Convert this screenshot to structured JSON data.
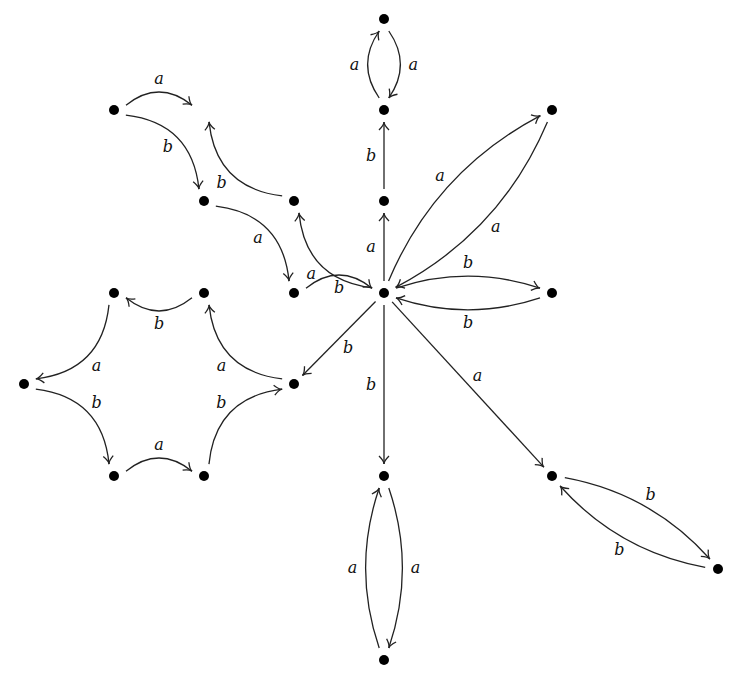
{
  "diagram": {
    "type": "directed-labeled-graph",
    "nodes": [
      {
        "id": "hub",
        "x": 384,
        "y": 293,
        "visible": true
      },
      {
        "id": "t1",
        "x": 384,
        "y": 201,
        "visible": true
      },
      {
        "id": "t2",
        "x": 384,
        "y": 110,
        "visible": true
      },
      {
        "id": "t3",
        "x": 384,
        "y": 19,
        "visible": true
      },
      {
        "id": "r1",
        "x": 552,
        "y": 110,
        "visible": true
      },
      {
        "id": "r2",
        "x": 552,
        "y": 293,
        "visible": true
      },
      {
        "id": "r3",
        "x": 552,
        "y": 476,
        "visible": true
      },
      {
        "id": "r4",
        "x": 718,
        "y": 569,
        "visible": true
      },
      {
        "id": "b1",
        "x": 384,
        "y": 476,
        "visible": true
      },
      {
        "id": "b2",
        "x": 384,
        "y": 660,
        "visible": true
      },
      {
        "id": "u1",
        "x": 294,
        "y": 201,
        "visible": true
      },
      {
        "id": "u0",
        "x": 204,
        "y": 110,
        "visible": false
      },
      {
        "id": "u2",
        "x": 114,
        "y": 110,
        "visible": true
      },
      {
        "id": "u3",
        "x": 204,
        "y": 201,
        "visible": true
      },
      {
        "id": "u4",
        "x": 294,
        "y": 293,
        "visible": true
      },
      {
        "id": "c1",
        "x": 294,
        "y": 384,
        "visible": true
      },
      {
        "id": "c2",
        "x": 204,
        "y": 293,
        "visible": true
      },
      {
        "id": "c3",
        "x": 114,
        "y": 293,
        "visible": true
      },
      {
        "id": "c4",
        "x": 24,
        "y": 384,
        "visible": true
      },
      {
        "id": "c5",
        "x": 114,
        "y": 476,
        "visible": true
      },
      {
        "id": "c6",
        "x": 204,
        "y": 476,
        "visible": true
      }
    ],
    "edges": [
      {
        "from": "hub",
        "to": "t1",
        "label": "a",
        "bend": 0,
        "labelSide": "left"
      },
      {
        "from": "t1",
        "to": "t2",
        "label": "b",
        "bend": 0,
        "labelSide": "left"
      },
      {
        "from": "t2",
        "to": "t3",
        "label": "a",
        "bend": 0.18,
        "labelSide": "left"
      },
      {
        "from": "t3",
        "to": "t2",
        "label": "a",
        "bend": 0.18,
        "labelSide": "left"
      },
      {
        "from": "hub",
        "to": "r1",
        "label": "a",
        "bend": 0.1,
        "labelSide": "left"
      },
      {
        "from": "r1",
        "to": "hub",
        "label": "a",
        "bend": 0.1,
        "labelSide": "left"
      },
      {
        "from": "hub",
        "to": "r2",
        "label": "b",
        "bend": 0.1,
        "labelSide": "left"
      },
      {
        "from": "r2",
        "to": "hub",
        "label": "b",
        "bend": 0.1,
        "labelSide": "left"
      },
      {
        "from": "hub",
        "to": "r3",
        "label": "a",
        "bend": 0,
        "labelSide": "left"
      },
      {
        "from": "r3",
        "to": "r4",
        "label": "b",
        "bend": 0.1,
        "labelSide": "left"
      },
      {
        "from": "r4",
        "to": "r3",
        "label": "b",
        "bend": 0.1,
        "labelSide": "left"
      },
      {
        "from": "hub",
        "to": "b1",
        "label": "b",
        "bend": 0,
        "labelSide": "right"
      },
      {
        "from": "b1",
        "to": "b2",
        "label": "a",
        "bend": 0.1,
        "labelSide": "left"
      },
      {
        "from": "b2",
        "to": "b1",
        "label": "a",
        "bend": 0.1,
        "labelSide": "left"
      },
      {
        "from": "hub",
        "to": "u1",
        "label": "a",
        "bend": 0.2,
        "labelSide": "left"
      },
      {
        "from": "u1",
        "to": "u0",
        "label": "b",
        "bend": 0.2,
        "labelSide": "left"
      },
      {
        "from": "u2",
        "to": "u0",
        "label": "a",
        "bend": 0.2,
        "labelSide": "left"
      },
      {
        "from": "u2",
        "to": "u3",
        "label": "b",
        "bend": 0.2,
        "labelSide": "right"
      },
      {
        "from": "u3",
        "to": "u4",
        "label": "a",
        "bend": 0.2,
        "labelSide": "right"
      },
      {
        "from": "u4",
        "to": "hub",
        "label": "b",
        "bend": 0.2,
        "labelSide": "right"
      },
      {
        "from": "hub",
        "to": "c1",
        "label": "b",
        "bend": 0,
        "labelSide": "left"
      },
      {
        "from": "c1",
        "to": "c2",
        "label": "a",
        "bend": 0.2,
        "labelSide": "left"
      },
      {
        "from": "c2",
        "to": "c3",
        "label": "b",
        "bend": 0.2,
        "labelSide": "left"
      },
      {
        "from": "c3",
        "to": "c4",
        "label": "a",
        "bend": 0.2,
        "labelSide": "left"
      },
      {
        "from": "c4",
        "to": "c5",
        "label": "b",
        "bend": 0.2,
        "labelSide": "left"
      },
      {
        "from": "c5",
        "to": "c6",
        "label": "a",
        "bend": 0.2,
        "labelSide": "left"
      },
      {
        "from": "c6",
        "to": "c1",
        "label": "b",
        "bend": 0.2,
        "labelSide": "left"
      }
    ]
  }
}
